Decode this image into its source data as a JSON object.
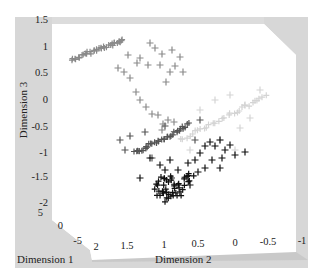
{
  "chart_data": {
    "type": "scatter",
    "projection": "3d",
    "title": "",
    "axes": {
      "x": {
        "label": "Dimension 1",
        "ticks": [
          "5",
          "0",
          "-5"
        ]
      },
      "y": {
        "label": "Dimension 2",
        "ticks": [
          "2",
          "1.5",
          "1",
          "0.5",
          "0",
          "-0.5",
          "-1"
        ]
      },
      "z": {
        "label": "Dimension 3",
        "ticks": [
          "1.5",
          "1",
          "0.5",
          "0",
          "-0.5",
          "-1",
          "-1.5",
          "-2"
        ]
      }
    },
    "zlim": [
      -2,
      1.5
    ],
    "ylim": [
      -1,
      2
    ],
    "xlim": [
      -5,
      5
    ],
    "grid": false,
    "marker": "+",
    "series": [
      {
        "name": "group-medium-gray",
        "color": "#8a8a8a",
        "description": "dense curved streak at upper left (Dimension 3 ≈ 0.5) with scattered crosses descending toward center",
        "streak": [
          [
            72,
            60
          ],
          [
            80,
            57
          ],
          [
            88,
            53
          ],
          [
            96,
            50
          ],
          [
            104,
            47
          ],
          [
            112,
            45
          ],
          [
            118,
            42
          ],
          [
            124,
            40
          ]
        ],
        "points": [
          [
            150,
            43
          ],
          [
            118,
            68
          ],
          [
            128,
            55
          ],
          [
            140,
            58
          ],
          [
            155,
            48
          ],
          [
            162,
            54
          ],
          [
            172,
            50
          ],
          [
            180,
            57
          ],
          [
            175,
            66
          ],
          [
            183,
            72
          ],
          [
            170,
            72
          ],
          [
            166,
            82
          ],
          [
            160,
            65
          ],
          [
            148,
            65
          ],
          [
            137,
            63
          ],
          [
            124,
            72
          ],
          [
            130,
            78
          ],
          [
            136,
            92
          ],
          [
            140,
            100
          ],
          [
            146,
            107
          ],
          [
            152,
            114
          ],
          [
            158,
            115
          ],
          [
            163,
            124
          ],
          [
            168,
            120
          ],
          [
            174,
            122
          ],
          [
            162,
            130
          ]
        ]
      },
      {
        "name": "group-light-gray",
        "color": "#d4d4d4",
        "description": "faint diagonal streak to the right (center-right), with few scattered crosses",
        "streak": [
          [
            180,
            140
          ],
          [
            195,
            132
          ],
          [
            210,
            125
          ],
          [
            225,
            117
          ],
          [
            240,
            110
          ],
          [
            255,
            102
          ],
          [
            268,
            95
          ]
        ],
        "points": [
          [
            200,
            110
          ],
          [
            215,
            100
          ],
          [
            230,
            95
          ],
          [
            240,
            128
          ],
          [
            250,
            118
          ],
          [
            190,
            150
          ],
          [
            220,
            140
          ],
          [
            235,
            150
          ],
          [
            260,
            90
          ],
          [
            245,
            105
          ]
        ]
      },
      {
        "name": "group-dark-gray",
        "color": "#555555",
        "description": "diagonal streak in center (Dimension 3 ≈ -1) with scattered crosses",
        "streak": [
          [
            135,
            153
          ],
          [
            142,
            150
          ],
          [
            150,
            145
          ],
          [
            158,
            141
          ],
          [
            166,
            137
          ],
          [
            174,
            133
          ],
          [
            182,
            128
          ],
          [
            190,
            123
          ]
        ],
        "points": [
          [
            120,
            140
          ],
          [
            125,
            150
          ],
          [
            130,
            136
          ],
          [
            145,
            132
          ],
          [
            152,
            158
          ],
          [
            165,
            126
          ],
          [
            200,
            120
          ],
          [
            195,
            140
          ]
        ]
      },
      {
        "name": "group-black",
        "color": "#111111",
        "description": "dense cluster at bottom center (Dimension 3 ≈ -1.8) with arm of crosses extending upper right",
        "cluster": [
          [
            160,
            185
          ],
          [
            165,
            190
          ],
          [
            170,
            195
          ],
          [
            172,
            180
          ],
          [
            175,
            188
          ],
          [
            168,
            200
          ],
          [
            178,
            192
          ],
          [
            182,
            186
          ],
          [
            186,
            180
          ],
          [
            190,
            175
          ],
          [
            164,
            178
          ],
          [
            158,
            192
          ]
        ],
        "points": [
          [
            160,
            165
          ],
          [
            165,
            170
          ],
          [
            178,
            170
          ],
          [
            188,
            163
          ],
          [
            195,
            160
          ],
          [
            200,
            153
          ],
          [
            205,
            146
          ],
          [
            210,
            142
          ],
          [
            215,
            146
          ],
          [
            220,
            140
          ],
          [
            225,
            150
          ],
          [
            230,
            145
          ],
          [
            222,
            158
          ],
          [
            212,
            160
          ],
          [
            205,
            168
          ],
          [
            198,
            172
          ],
          [
            235,
            155
          ],
          [
            245,
            152
          ],
          [
            220,
            168
          ],
          [
            190,
            185
          ],
          [
            150,
            158
          ],
          [
            140,
            178
          ],
          [
            170,
            160
          ]
        ]
      }
    ]
  }
}
